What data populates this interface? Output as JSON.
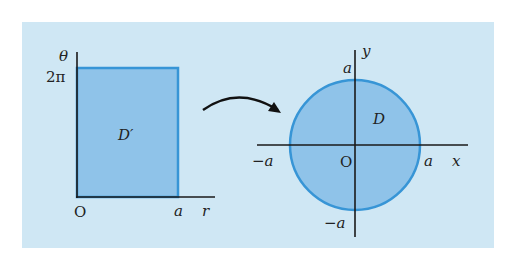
{
  "colors": {
    "background_panel": "#cfe7f4",
    "region_fill": "#8fc3e9",
    "region_stroke": "#3795d6",
    "axis": "#1a1a1a",
    "arrow": "#111111"
  },
  "left_plot": {
    "theta_axis_label": "θ",
    "r_axis_label": "r",
    "top_tick_label": "2π",
    "origin_label": "O",
    "r_tick_label": "a",
    "region_label": "D′"
  },
  "right_plot": {
    "y_axis_label": "y",
    "x_axis_label": "x",
    "origin_label": "O",
    "top_tick_label": "a",
    "bottom_tick_label": "−a",
    "left_tick_label": "−a",
    "right_tick_label": "a",
    "region_label": "D"
  },
  "arrow": {
    "meaning": "maps D′ to D"
  }
}
